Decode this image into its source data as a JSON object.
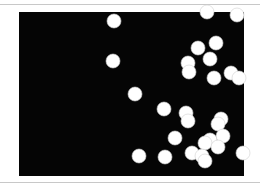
{
  "figure": {
    "background_color": "#050505",
    "dot_color": "#ffffff",
    "dot_radius": 7,
    "field": {
      "x": 19,
      "y": 12,
      "width": 225,
      "height": 164
    },
    "dots": [
      [
        114,
        21
      ],
      [
        207,
        12
      ],
      [
        237,
        15
      ],
      [
        113,
        61
      ],
      [
        198,
        48
      ],
      [
        216,
        43
      ],
      [
        210,
        59
      ],
      [
        188,
        63
      ],
      [
        189,
        72
      ],
      [
        214,
        78
      ],
      [
        231,
        73
      ],
      [
        239,
        78
      ],
      [
        135,
        94
      ],
      [
        164,
        109
      ],
      [
        186,
        113
      ],
      [
        188,
        121
      ],
      [
        221,
        119
      ],
      [
        218,
        124
      ],
      [
        175,
        138
      ],
      [
        223,
        136
      ],
      [
        210,
        140
      ],
      [
        205,
        143
      ],
      [
        218,
        147
      ],
      [
        139,
        156
      ],
      [
        165,
        157
      ],
      [
        192,
        153
      ],
      [
        202,
        156
      ],
      [
        205,
        161
      ],
      [
        243,
        153
      ]
    ]
  }
}
